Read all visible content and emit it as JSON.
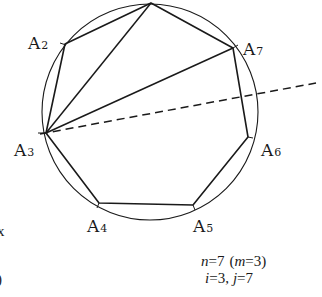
{
  "figure": {
    "circle": {
      "cx": 150,
      "cy": 112,
      "r": 108
    },
    "vertices": [
      {
        "name": "A1",
        "label": "",
        "x": 151,
        "y": 3
      },
      {
        "name": "A2",
        "label": "A",
        "sub": "2",
        "x": 65,
        "y": 44,
        "lx": 28,
        "ly": 44
      },
      {
        "name": "A3",
        "label": "A",
        "sub": "3",
        "x": 46,
        "y": 133,
        "lx": 14,
        "ly": 151
      },
      {
        "name": "A4",
        "label": "A",
        "sub": "4",
        "x": 99,
        "y": 203,
        "lx": 88,
        "ly": 227
      },
      {
        "name": "A5",
        "label": "A",
        "sub": "5",
        "x": 193,
        "y": 205,
        "lx": 193,
        "ly": 227
      },
      {
        "name": "A6",
        "label": "A",
        "sub": "6",
        "x": 248,
        "y": 137,
        "lx": 260,
        "ly": 151
      },
      {
        "name": "A7",
        "label": "A",
        "sub": "7",
        "x": 233,
        "y": 48,
        "lx": 243,
        "ly": 53
      }
    ],
    "diagonals": [
      {
        "from": "A3",
        "to": "A1"
      },
      {
        "from": "A3",
        "to": "A7"
      }
    ],
    "dashed_line": {
      "from": "A3",
      "x2": 316,
      "y2": 83
    },
    "caption": {
      "line1_n": "n",
      "line1_eq": "=7",
      "line1_paren_open": "(",
      "line1_m": "m",
      "line1_m_eq": "=3)",
      "line2_i": "i",
      "line2_i_eq": "=3,",
      "line2_j": "j",
      "line2_j_eq": "=7"
    },
    "margin_marks": [
      "x",
      ")"
    ],
    "colors": {
      "stroke": "#1a1a1a",
      "background": "#ffffff"
    }
  }
}
